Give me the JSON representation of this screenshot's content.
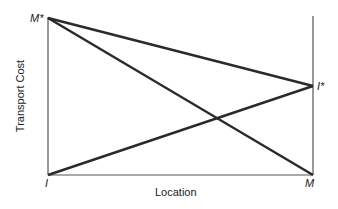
{
  "diagram": {
    "type": "line-diagram",
    "xlabel": "Location",
    "ylabel": "Transport Cost",
    "points": {
      "m_star": {
        "label": "M*",
        "x": 48,
        "y": 18
      },
      "i_star": {
        "label": "I*",
        "x": 313,
        "y": 86
      },
      "i": {
        "label": "I",
        "x": 48,
        "y": 175
      },
      "m": {
        "label": "M",
        "x": 313,
        "y": 175
      }
    },
    "lines": [
      {
        "name": "M* to I*",
        "from": "m_star",
        "to": "i_star"
      },
      {
        "name": "M* to M",
        "from": "m_star",
        "to": "m"
      },
      {
        "name": "I to I*",
        "from": "i",
        "to": "i_star"
      }
    ],
    "colors": {
      "line": "#2a2a2a",
      "axis": "#555555",
      "background": "#ffffff"
    }
  }
}
